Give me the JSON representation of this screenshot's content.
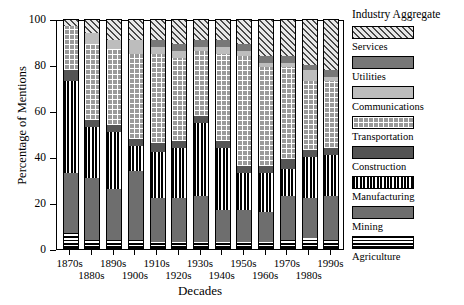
{
  "chart_data": {
    "type": "bar",
    "subtype": "stacked-bar-100-percent",
    "title": "",
    "xlabel": "Decades",
    "ylabel": "Percentage of Mentions",
    "ylim": [
      0,
      100
    ],
    "yticks": [
      0,
      20,
      40,
      60,
      80,
      100
    ],
    "ytick_labels": [
      "0",
      "20",
      "40",
      "60",
      "80",
      "100"
    ],
    "grid": false,
    "legend_position": "right",
    "legend_title": "Industry Aggregate",
    "categories": [
      "1870s",
      "1880s",
      "1890s",
      "1900s",
      "1910s",
      "1920s",
      "1930s",
      "1940s",
      "1950s",
      "1960s",
      "1970s",
      "1980s",
      "1990s"
    ],
    "series": [
      {
        "name": "Agriculture",
        "pattern": "horizontal-stripes",
        "color": "#ffffff",
        "values": [
          7,
          4,
          4,
          4,
          3,
          3,
          3,
          3,
          3,
          3,
          4,
          5,
          4
        ]
      },
      {
        "name": "Mining",
        "pattern": "solid-gray",
        "color": "#6e6e6e",
        "values": [
          26,
          27,
          22,
          30,
          19,
          19,
          20,
          14,
          14,
          13,
          19,
          17,
          19
        ]
      },
      {
        "name": "Manufacturing",
        "pattern": "vertical-stripes",
        "color": "#000000",
        "values": [
          40,
          22,
          25,
          11,
          20,
          22,
          32,
          27,
          16,
          17,
          12,
          18,
          18
        ]
      },
      {
        "name": "Construction",
        "pattern": "solid-dark-gray",
        "color": "#545454",
        "values": [
          5,
          3,
          3,
          3,
          4,
          3,
          3,
          3,
          3,
          3,
          4,
          3,
          3
        ]
      },
      {
        "name": "Transportation",
        "pattern": "grid",
        "color": "#9a9a9a",
        "values": [
          19,
          33,
          33,
          37,
          39,
          36,
          28,
          38,
          48,
          43,
          40,
          30,
          29
        ]
      },
      {
        "name": "Communications",
        "pattern": "solid-light-gray",
        "color": "#bdbdbd",
        "values": [
          0,
          5,
          4,
          6,
          3,
          3,
          2,
          3,
          2,
          2,
          2,
          5,
          2
        ]
      },
      {
        "name": "Utilities",
        "pattern": "solid-medium-gray",
        "color": "#777777",
        "values": [
          0,
          0,
          0,
          0,
          3,
          3,
          3,
          3,
          3,
          3,
          3,
          2,
          3
        ]
      },
      {
        "name": "Services",
        "pattern": "diagonal-hatch",
        "color": "#d9d9d9",
        "values": [
          3,
          6,
          9,
          9,
          9,
          11,
          9,
          9,
          11,
          16,
          16,
          20,
          22
        ]
      }
    ]
  },
  "legend": {
    "title": "Industry Aggregate",
    "entries": [
      {
        "label": "Services",
        "pattern": "diagonal-hatch"
      },
      {
        "label": "Utilities",
        "pattern": "solid-medium-gray"
      },
      {
        "label": "Communications",
        "pattern": "solid-light-gray"
      },
      {
        "label": "Transportation",
        "pattern": "grid"
      },
      {
        "label": "Construction",
        "pattern": "solid-dark-gray"
      },
      {
        "label": "Manufacturing",
        "pattern": "vertical-stripes"
      },
      {
        "label": "Mining",
        "pattern": "solid-gray"
      },
      {
        "label": "Agriculture",
        "pattern": "horizontal-stripes"
      }
    ]
  },
  "axes": {
    "y_title": "Percentage of Mentions",
    "x_title": "Decades"
  }
}
